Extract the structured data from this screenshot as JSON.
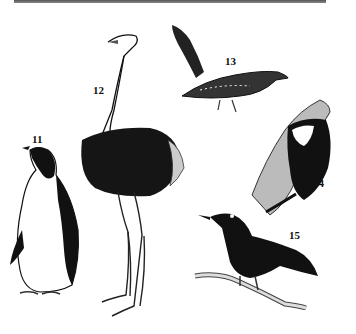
{
  "figure": {
    "style": "black-and-white ink illustration",
    "birds": [
      {
        "number": "11",
        "name": "penguin",
        "label_pos": [
          32,
          133
        ]
      },
      {
        "number": "12",
        "name": "ostrich",
        "label_pos": [
          93,
          84
        ]
      },
      {
        "number": "13",
        "name": "cuckoo",
        "label_pos": [
          225,
          55
        ]
      },
      {
        "number": "14",
        "name": "woodpecker",
        "label_pos": [
          313,
          177
        ]
      },
      {
        "number": "15",
        "name": "blackbird",
        "label_pos": [
          289,
          229
        ]
      }
    ]
  }
}
